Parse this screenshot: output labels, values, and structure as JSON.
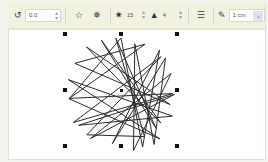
{
  "toolbar": {
    "rotation": {
      "icon": "rotate-icon",
      "value": "0.0"
    },
    "star_mode_buttons": [
      {
        "icon": "polygon-star-icon"
      },
      {
        "icon": "complex-star-icon"
      }
    ],
    "points": {
      "icon": "star-points-icon",
      "value": "15"
    },
    "sharpness": {
      "icon": "sharpness-icon",
      "value": "4"
    },
    "wrap": {
      "icon": "wrap-text-icon"
    },
    "outline": {
      "icon": "outline-pen-icon",
      "value": "1 cm"
    }
  },
  "canvas": {
    "shape": "complex star",
    "points": 15,
    "stroke_color": "#2a2a2a",
    "center": [
      121,
      90
    ]
  }
}
